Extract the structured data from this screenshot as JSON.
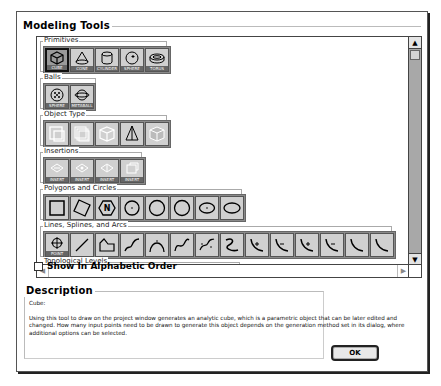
{
  "dialog": {
    "modeling_tools_title": "Modeling Tools",
    "categories": [
      {
        "title": "Primitives",
        "tools": [
          {
            "name": "cube",
            "label": "CUBE",
            "selected": true
          },
          {
            "name": "cone",
            "label": "CONE"
          },
          {
            "name": "cylinder",
            "label": "CYLINDER"
          },
          {
            "name": "sphere",
            "label": "SPHERE"
          },
          {
            "name": "torus",
            "label": "TORUS"
          }
        ]
      },
      {
        "title": "Balls",
        "tools": [
          {
            "name": "geosphere",
            "label": "SPHERE"
          },
          {
            "name": "metaball",
            "label": "METABALL"
          }
        ]
      },
      {
        "title": "Object Type",
        "tools": [
          {
            "name": "object-type-1"
          },
          {
            "name": "object-type-2"
          },
          {
            "name": "object-type-3"
          },
          {
            "name": "object-type-4"
          },
          {
            "name": "object-type-5"
          }
        ]
      },
      {
        "title": "Insertions",
        "tools": [
          {
            "name": "insertion-1",
            "label": "INSERT"
          },
          {
            "name": "insertion-2",
            "label": "INSERT"
          },
          {
            "name": "insertion-3",
            "label": "INSERT"
          },
          {
            "name": "insertion-4",
            "label": "INSERT"
          }
        ]
      },
      {
        "title": "Polygons and Circles",
        "tools": [
          {
            "name": "rectangle"
          },
          {
            "name": "rotated-rectangle"
          },
          {
            "name": "n-gon",
            "glyph": "N"
          },
          {
            "name": "circle-center"
          },
          {
            "name": "circle-2pt"
          },
          {
            "name": "circle-3pt"
          },
          {
            "name": "ellipse-center"
          },
          {
            "name": "ellipse"
          }
        ]
      },
      {
        "title": "Lines, Splines, and Arcs",
        "tools": [
          {
            "name": "point",
            "label": "POINT"
          },
          {
            "name": "line"
          },
          {
            "name": "polyline"
          },
          {
            "name": "spline-1"
          },
          {
            "name": "spline-2"
          },
          {
            "name": "spline-3"
          },
          {
            "name": "spline-4"
          },
          {
            "name": "freehand"
          },
          {
            "name": "arc-1"
          },
          {
            "name": "arc-2"
          },
          {
            "name": "arc-3"
          },
          {
            "name": "arc-4"
          },
          {
            "name": "arc-5"
          },
          {
            "name": "arc-6"
          }
        ]
      },
      {
        "title": "Topological Levels",
        "tools": []
      }
    ],
    "show_alphabetic": {
      "label": "Show In Alphabetic Order",
      "checked": false
    },
    "description": {
      "title": "Description",
      "subject": "Cube:",
      "text": "Using this tool to draw on the project window generates an analytic cube, which is a parametric object that can be later edited and changed.  How many input points need to be drawn to generate this object depends on the generation method set in its dialog, where additional options can be selected."
    },
    "ok_label": "OK"
  }
}
